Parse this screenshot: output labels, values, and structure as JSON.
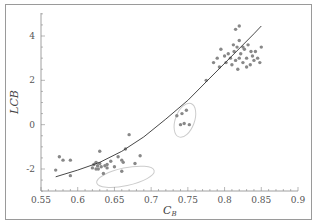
{
  "chart_data": {
    "type": "scatter",
    "title": "",
    "xlabel": "C_B",
    "xlabel_main": "C",
    "xlabel_sub": "B",
    "ylabel": "LCB",
    "xlim": [
      0.55,
      0.9
    ],
    "ylim": [
      -3,
      5
    ],
    "x_ticks": [
      "0.55",
      "0.6",
      "0.65",
      "0.7",
      "0.75",
      "0.8",
      "0.85",
      "0.9"
    ],
    "y_ticks": [
      "4",
      "2",
      "0",
      "-2"
    ],
    "grid": false,
    "legend": null,
    "series": [
      {
        "name": "data points",
        "type": "scatter",
        "color": "#888888",
        "points": [
          [
            0.57,
            -2.05
          ],
          [
            0.575,
            -1.45
          ],
          [
            0.58,
            -1.6
          ],
          [
            0.59,
            -1.6
          ],
          [
            0.59,
            -2.3
          ],
          [
            0.62,
            -1.95
          ],
          [
            0.622,
            -1.8
          ],
          [
            0.625,
            -1.7
          ],
          [
            0.627,
            -1.85
          ],
          [
            0.628,
            -2.0
          ],
          [
            0.63,
            -1.75
          ],
          [
            0.632,
            -1.9
          ],
          [
            0.635,
            -2.2
          ],
          [
            0.637,
            -1.85
          ],
          [
            0.64,
            -1.95
          ],
          [
            0.63,
            -1.2
          ],
          [
            0.645,
            -1.65
          ],
          [
            0.65,
            -1.9
          ],
          [
            0.655,
            -1.45
          ],
          [
            0.66,
            -1.6
          ],
          [
            0.66,
            -2.1
          ],
          [
            0.662,
            -1.7
          ],
          [
            0.665,
            -1.1
          ],
          [
            0.67,
            -0.45
          ],
          [
            0.678,
            -1.75
          ],
          [
            0.685,
            -1.4
          ],
          [
            0.64,
            -1.8
          ],
          [
            0.625,
            -2.0
          ],
          [
            0.735,
            0.4
          ],
          [
            0.742,
            0.5
          ],
          [
            0.748,
            0.65
          ],
          [
            0.74,
            0.0
          ],
          [
            0.745,
            0.05
          ],
          [
            0.752,
            0.0
          ],
          [
            0.775,
            2.0
          ],
          [
            0.785,
            2.8
          ],
          [
            0.79,
            3.0
          ],
          [
            0.793,
            2.6
          ],
          [
            0.795,
            3.4
          ],
          [
            0.8,
            3.1
          ],
          [
            0.802,
            2.8
          ],
          [
            0.805,
            3.2
          ],
          [
            0.808,
            3.0
          ],
          [
            0.81,
            2.7
          ],
          [
            0.812,
            3.6
          ],
          [
            0.813,
            3.3
          ],
          [
            0.815,
            2.9
          ],
          [
            0.817,
            3.5
          ],
          [
            0.82,
            3.8
          ],
          [
            0.82,
            3.0
          ],
          [
            0.822,
            3.2
          ],
          [
            0.825,
            2.8
          ],
          [
            0.827,
            3.4
          ],
          [
            0.83,
            3.0
          ],
          [
            0.832,
            3.6
          ],
          [
            0.835,
            2.7
          ],
          [
            0.838,
            3.1
          ],
          [
            0.84,
            2.9
          ],
          [
            0.842,
            3.3
          ],
          [
            0.845,
            3.0
          ],
          [
            0.848,
            2.8
          ],
          [
            0.85,
            3.5
          ],
          [
            0.815,
            4.3
          ],
          [
            0.82,
            4.45
          ],
          [
            0.818,
            2.5
          ],
          [
            0.825,
            3.5
          ],
          [
            0.83,
            2.6
          ],
          [
            0.836,
            3.3
          ]
        ]
      },
      {
        "name": "fit curve",
        "type": "line",
        "color": "#333333",
        "points": [
          [
            0.57,
            -2.35
          ],
          [
            0.6,
            -2.05
          ],
          [
            0.63,
            -1.7
          ],
          [
            0.66,
            -1.2
          ],
          [
            0.69,
            -0.55
          ],
          [
            0.72,
            0.25
          ],
          [
            0.75,
            1.1
          ],
          [
            0.78,
            2.1
          ],
          [
            0.81,
            3.1
          ],
          [
            0.84,
            4.1
          ],
          [
            0.85,
            4.45
          ]
        ]
      }
    ],
    "annotations": [
      {
        "type": "ellipse",
        "center": [
          0.665,
          -2.35
        ],
        "rx_data": 0.04,
        "ry_data": 0.4,
        "color": "#cccccc"
      },
      {
        "type": "ellipse",
        "center": [
          0.746,
          0.2
        ],
        "rx_data": 0.013,
        "ry_data": 0.8,
        "color": "#cccccc"
      }
    ]
  }
}
